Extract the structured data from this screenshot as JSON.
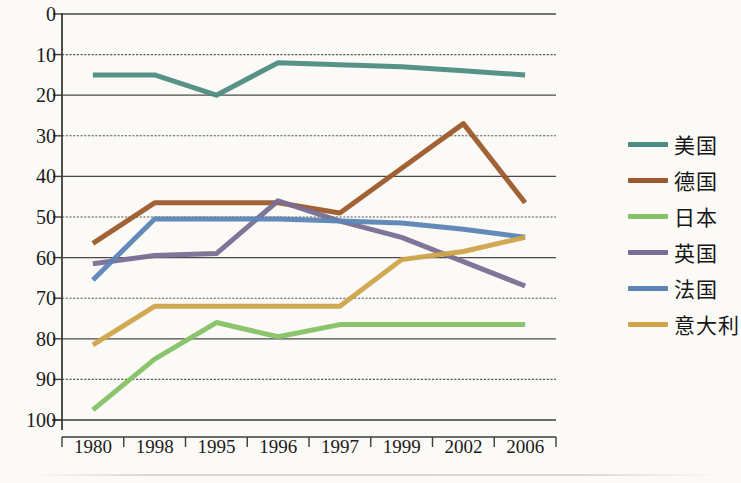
{
  "chart_data": {
    "type": "line",
    "title": "",
    "xlabel": "",
    "ylabel": "",
    "categories": [
      "1980",
      "1998",
      "1995",
      "1996",
      "1997",
      "1999",
      "2002",
      "2006"
    ],
    "ylim": [
      0,
      100
    ],
    "yticks": [
      0,
      10,
      20,
      30,
      40,
      50,
      60,
      70,
      80,
      90,
      100
    ],
    "grid": true,
    "legend_position": "right",
    "series": [
      {
        "name": "美国",
        "color": "#4d8c82",
        "values": [
          85,
          85,
          80,
          88,
          87.5,
          87,
          86,
          85
        ]
      },
      {
        "name": "德国",
        "color": "#9c5a2a",
        "values": [
          43.5,
          53.5,
          53.5,
          53.5,
          51,
          62,
          73,
          53.5
        ]
      },
      {
        "name": "日本",
        "color": "#86c166",
        "values": [
          2.5,
          15,
          24,
          20.5,
          23.5,
          23.5,
          23.5,
          23.5
        ]
      },
      {
        "name": "英国",
        "color": "#7a6d94",
        "values": [
          38.5,
          40.5,
          41,
          54,
          49,
          45,
          39,
          33
        ]
      },
      {
        "name": "法国",
        "color": "#5b85b5",
        "values": [
          34.5,
          49.5,
          49.5,
          49.5,
          49,
          48.5,
          47,
          45
        ]
      },
      {
        "name": "意大利",
        "color": "#cfa44a",
        "values": [
          18.5,
          28,
          28,
          28,
          28,
          39.5,
          41.5,
          45
        ]
      }
    ]
  },
  "axis": {
    "y_tick_labels": [
      "100",
      "90",
      "80",
      "70",
      "60",
      "50",
      "40",
      "30",
      "20",
      "10",
      "0"
    ],
    "x_tick_labels": [
      "1980",
      "1998",
      "1995",
      "1996",
      "1997",
      "1999",
      "2002",
      "2006"
    ]
  },
  "legend": {
    "items": [
      {
        "label": "美国",
        "color": "#4d8c82"
      },
      {
        "label": "德国",
        "color": "#9c5a2a"
      },
      {
        "label": "日本",
        "color": "#86c166"
      },
      {
        "label": "英国",
        "color": "#7a6d94"
      },
      {
        "label": "法国",
        "color": "#5b85b5"
      },
      {
        "label": "意大利",
        "color": "#cfa44a"
      }
    ]
  }
}
